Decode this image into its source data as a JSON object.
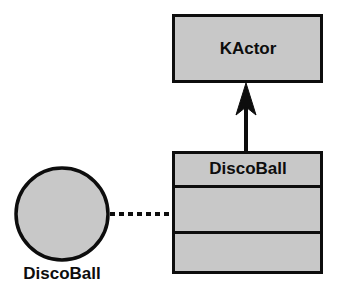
{
  "diagram": {
    "type": "uml-class-diagram",
    "title": "",
    "background_color": "#ffffff",
    "node_fill_color": "#c8c8c8",
    "stroke_color": "#0d0d0d",
    "text_color": "#0d0d0d"
  },
  "nodes": {
    "kactor_class": {
      "name": "KActor",
      "kind": "class",
      "compartments": [
        "KActor"
      ],
      "x": 172,
      "y": 14,
      "width": 151,
      "height": 69,
      "fill": "#c8c8c8"
    },
    "discoball_class": {
      "name": "DiscoBall",
      "kind": "class",
      "compartments": [
        "DiscoBall",
        "",
        ""
      ],
      "x": 172,
      "y": 151,
      "width": 151,
      "height": 123,
      "divider_y": [
        186,
        232
      ],
      "fill": "#c8c8c8"
    },
    "discoball_object": {
      "name": "DiscoBall",
      "kind": "object-instance",
      "shape": "circle",
      "cx": 62,
      "cy": 214,
      "r": 47,
      "label_x": 62,
      "label_y": 274,
      "fill": "#c8c8c8"
    }
  },
  "edges": {
    "generalization": {
      "kind": "generalization",
      "from": "discoball_class",
      "to": "kactor_class",
      "style": "solid",
      "arrowhead": "filled-triangle",
      "x": 246,
      "y_start": 151,
      "y_end": 84
    },
    "dependency": {
      "kind": "dependency",
      "from": "discoball_object",
      "to": "discoball_class",
      "style": "dashed",
      "arrowhead": "none",
      "x_start": 110,
      "x_end": 172,
      "y": 214,
      "dash_pattern": "5 4"
    }
  }
}
